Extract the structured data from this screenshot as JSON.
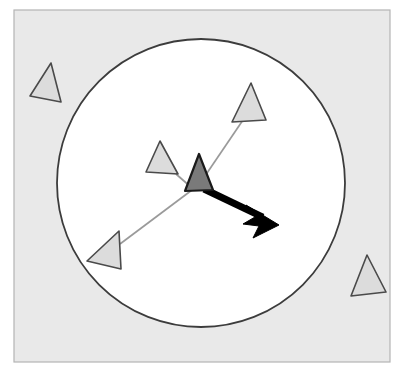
{
  "figure": {
    "title": "Agent perception neighborhood",
    "width": 405,
    "height": 375
  },
  "colors": {
    "page_background": "#ffffff",
    "panel_fill": "#e9e9e9",
    "panel_stroke": "#b4b4b4",
    "circle_fill": "#ffffff",
    "circle_stroke": "#3c3c3c",
    "focal_agent_fill": "#7a7a7a",
    "focal_agent_stroke": "#1a1a1a",
    "neighbor_fill": "#dcdcdc",
    "neighbor_stroke": "#4a4a4a",
    "link_stroke": "#9a9a9a",
    "arrow_fill": "#000000"
  },
  "panel": {
    "name": "plot-panel",
    "x": 14,
    "y": 10,
    "width": 376,
    "height": 352,
    "stroke_width": 1.2
  },
  "perception_circle": {
    "name": "perception-radius-circle",
    "cx": 201,
    "cy": 183,
    "r": 144,
    "stroke_width": 1.8
  },
  "focal_agent": {
    "label": "focal-agent",
    "points": "199,154 213,190 185,191",
    "centroid": [
      199,
      178
    ]
  },
  "heading_arrow": {
    "label": "heading-arrow",
    "start": [
      204,
      189
    ],
    "tip": [
      279,
      225
    ],
    "shaft_width": 7,
    "head_points": "279,225 246,205 255,217 243,224 259,226 253,238"
  },
  "neighbors_inside": [
    {
      "label": "neighbor-agent-top-right",
      "points": "251,83 266,120 232,122",
      "link_from": [
        205,
        176
      ],
      "link_to": [
        243,
        120
      ]
    },
    {
      "label": "neighbor-agent-mid-left",
      "points": "160,141 178,174 146,172",
      "link_from": [
        192,
        188
      ],
      "link_to": [
        176,
        174
      ]
    },
    {
      "label": "neighbor-agent-lower-left",
      "points": "119,231 121,269 87,261",
      "link_from": [
        192,
        190
      ],
      "link_to": [
        120,
        244
      ]
    }
  ],
  "neighbors_outside": [
    {
      "label": "outside-agent-top-left",
      "points": "51,63 61,102 30,96"
    },
    {
      "label": "outside-agent-bottom-right",
      "points": "367,255 386,292 351,296"
    }
  ]
}
